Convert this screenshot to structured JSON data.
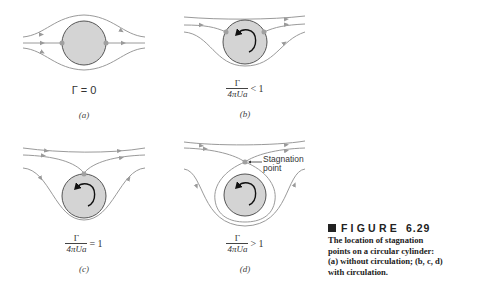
{
  "figure": {
    "number_label": "FIGURE",
    "number": "6.29",
    "caption_lines": [
      "The location of stagnation",
      "points on a circular cylinder:",
      "(a) without circulation; (b, c, d)",
      "with circulation."
    ]
  },
  "panels": [
    {
      "id": "a",
      "sublabel": "(a)",
      "condition_text": "Γ = 0"
    },
    {
      "id": "b",
      "sublabel": "(b)",
      "numerator": "Γ",
      "denominator": "4πUa",
      "relation": "< 1"
    },
    {
      "id": "c",
      "sublabel": "(c)",
      "numerator": "Γ",
      "denominator": "4πUa",
      "relation": "= 1"
    },
    {
      "id": "d",
      "sublabel": "(d)",
      "numerator": "Γ",
      "denominator": "4πUa",
      "relation": "> 1",
      "annotation": [
        "Stagnation",
        "point"
      ]
    }
  ],
  "colors": {
    "streamline": "#9a9a9a",
    "cylinder_fill": "#d4d4d4",
    "cylinder_stroke": "#555555",
    "stagnation_dot": "#a0a0a0",
    "arrow": "#111111"
  }
}
